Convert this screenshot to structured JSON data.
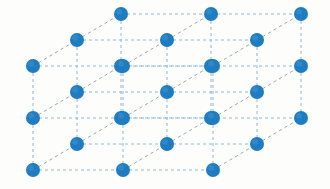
{
  "figure": {
    "kind": "diagram",
    "projection": "oblique",
    "background_color": "#fdfdfc",
    "canvas": {
      "width": 330,
      "height": 189
    }
  },
  "lattice": {
    "type": "simple-cubic",
    "dimensions": {
      "nx": 3,
      "ny": 3,
      "nz": 3
    },
    "atom_count": 27,
    "atom": {
      "label": "lattice-point",
      "color": "#1f7cc0",
      "highlight_color": "#3d93cf",
      "radius": 7
    },
    "bond": {
      "label": "lattice-edge",
      "color": "#8fb8d8",
      "depth_color": "#9aa9b4",
      "style": "dashed",
      "dash": "3 3",
      "width": 1
    },
    "basis": {
      "origin": {
        "x": 33,
        "y": 170
      },
      "a_step": {
        "dx": 90,
        "dy": 0
      },
      "b_step": {
        "dx": 0,
        "dy": -52
      },
      "c_step": {
        "dx": 44,
        "dy": -26
      }
    }
  }
}
